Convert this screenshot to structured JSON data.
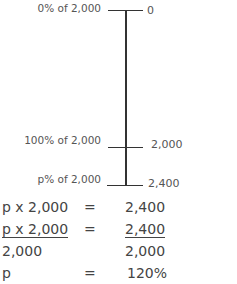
{
  "diagram": {
    "ticks": [
      {
        "left_label": "0% of 2,000",
        "right_label": "0"
      },
      {
        "left_label": "100% of 2,000",
        "right_label": "2,000"
      },
      {
        "left_label": "p% of 2,000",
        "right_label": "2,400"
      }
    ]
  },
  "equations": {
    "row1": {
      "left": "p x 2,000",
      "op": "=",
      "right": "2,400"
    },
    "row2": {
      "left": "p x 2,000",
      "op": "=",
      "right": "2,400"
    },
    "row3": {
      "left": "2,000",
      "op": "",
      "right": "2,000"
    },
    "row4": {
      "left": "p",
      "op": "=",
      "right": "120%"
    }
  }
}
